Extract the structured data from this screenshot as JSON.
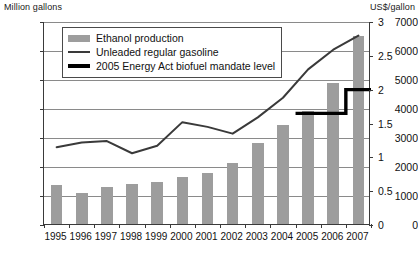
{
  "chart_data": {
    "type": "bar",
    "title": "",
    "subtitle": "",
    "xlabel": "",
    "ylabel": "Million gallons",
    "ylabel_right": "US$/gallon",
    "grid": true,
    "legend_position": "top-left",
    "categories": [
      "1995",
      "1996",
      "1997",
      "1998",
      "1999",
      "2000",
      "2001",
      "2002",
      "2003",
      "2004",
      "2005",
      "2006",
      "2007"
    ],
    "ylim": [
      0,
      7000
    ],
    "yticks": [
      0,
      1000,
      2000,
      3000,
      4000,
      5000,
      6000,
      7000
    ],
    "ylim_right": [
      0,
      3
    ],
    "yticks_right": [
      0,
      0.5,
      1,
      1.5,
      2,
      2.5,
      3
    ],
    "ytick_labels_right": [
      "0",
      "0.5",
      "1",
      "1.5",
      "2",
      "2.5",
      "3"
    ],
    "series": [
      {
        "name": "Ethanol production",
        "type": "bar",
        "axis": "left",
        "unit": "Million gallons",
        "color": "#9d9d9d",
        "values": [
          1360,
          1080,
          1290,
          1370,
          1440,
          1630,
          1770,
          2120,
          2800,
          3400,
          3900,
          4850,
          6500
        ]
      },
      {
        "name": "Unleaded regular gasoline",
        "type": "line",
        "axis": "right",
        "unit": "US$/gallon",
        "color": "#3a3a3a",
        "values": [
          1.15,
          1.22,
          1.24,
          1.06,
          1.17,
          1.52,
          1.45,
          1.35,
          1.59,
          1.88,
          2.3,
          2.59,
          2.8
        ]
      },
      {
        "name": "2005 Energy Act biofuel mandate level",
        "type": "step",
        "axis": "right",
        "unit": "US$/gallon",
        "color": "#000000",
        "values": [
          null,
          null,
          null,
          null,
          null,
          null,
          null,
          null,
          null,
          null,
          1.65,
          1.65,
          2.0
        ]
      }
    ]
  },
  "legend": {
    "items": [
      {
        "label": "Ethanol production",
        "marker": "bar-swatch-icon"
      },
      {
        "label": "Unleaded regular gasoline",
        "marker": "thin-line-icon"
      },
      {
        "label": "2005 Energy Act biofuel mandate level",
        "marker": "thick-line-icon"
      }
    ]
  }
}
